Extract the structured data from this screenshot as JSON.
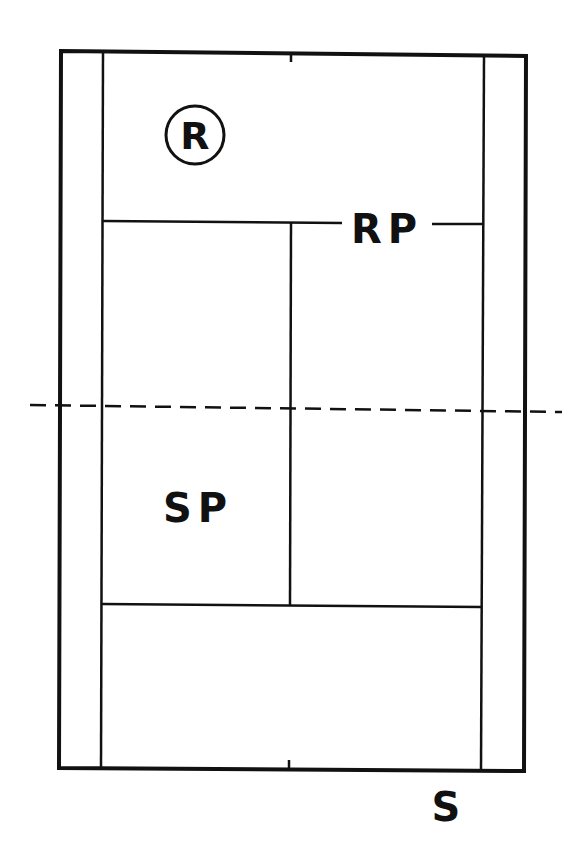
{
  "diagram": {
    "type": "tennis-court-top-view",
    "labels": {
      "receiver_marker": "R",
      "receiver_position": "RP",
      "server_position": "SP",
      "server": "S"
    },
    "colors": {
      "line": "#111111",
      "background": "#ffffff"
    }
  }
}
